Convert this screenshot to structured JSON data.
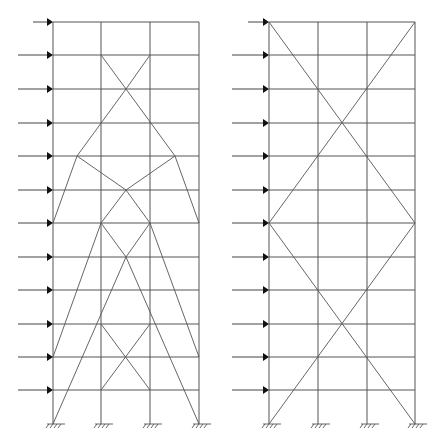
{
  "diagram": {
    "title": "",
    "colors": {
      "member": "#555555",
      "arrow": "#111111",
      "background": "#ffffff"
    },
    "floors_y": [
      22,
      55,
      89,
      123,
      156,
      190,
      223,
      257,
      290,
      324,
      357,
      390
    ],
    "base_y": 424,
    "frames": [
      {
        "name": "left-frame",
        "columns_x": [
          53,
          101,
          150,
          199
        ],
        "load_arrows": [
          {
            "x1": 33,
            "y": 22
          },
          {
            "x1": 18,
            "y": 55
          },
          {
            "x1": 18,
            "y": 89
          },
          {
            "x1": 18,
            "y": 123
          },
          {
            "x1": 18,
            "y": 156
          },
          {
            "x1": 18,
            "y": 190
          },
          {
            "x1": 18,
            "y": 223
          },
          {
            "x1": 18,
            "y": 257
          },
          {
            "x1": 18,
            "y": 290
          },
          {
            "x1": 18,
            "y": 324
          },
          {
            "x1": 18,
            "y": 357
          },
          {
            "x1": 18,
            "y": 390
          }
        ],
        "braces": [
          [
            101,
            55,
            126,
            89
          ],
          [
            150,
            55,
            126,
            89
          ],
          [
            126,
            89,
            77,
            156
          ],
          [
            126,
            89,
            175,
            156
          ],
          [
            77,
            156,
            53,
            223
          ],
          [
            175,
            156,
            199,
            223
          ],
          [
            77,
            156,
            126,
            190
          ],
          [
            175,
            156,
            126,
            190
          ],
          [
            126,
            190,
            101,
            223
          ],
          [
            126,
            190,
            150,
            223
          ],
          [
            101,
            223,
            126,
            257
          ],
          [
            150,
            223,
            126,
            257
          ],
          [
            101,
            223,
            53,
            357
          ],
          [
            150,
            223,
            199,
            357
          ],
          [
            126,
            257,
            53,
            424
          ],
          [
            126,
            257,
            199,
            424
          ],
          [
            101,
            324,
            150,
            390
          ],
          [
            150,
            324,
            101,
            390
          ]
        ]
      },
      {
        "name": "right-frame",
        "columns_x": [
          269,
          318,
          367,
          415
        ],
        "load_arrows": [
          {
            "x1": 248,
            "y": 22
          },
          {
            "x1": 232,
            "y": 55
          },
          {
            "x1": 232,
            "y": 89
          },
          {
            "x1": 232,
            "y": 123
          },
          {
            "x1": 232,
            "y": 156
          },
          {
            "x1": 232,
            "y": 190
          },
          {
            "x1": 232,
            "y": 223
          },
          {
            "x1": 232,
            "y": 257
          },
          {
            "x1": 232,
            "y": 290
          },
          {
            "x1": 232,
            "y": 324
          },
          {
            "x1": 232,
            "y": 357
          },
          {
            "x1": 232,
            "y": 390
          }
        ],
        "braces": [
          [
            269,
            22,
            415,
            223
          ],
          [
            415,
            22,
            269,
            223
          ],
          [
            269,
            223,
            415,
            424
          ],
          [
            415,
            223,
            269,
            424
          ]
        ]
      }
    ],
    "support_symbol": "fixed-support-hatch",
    "arrow_symbol": "lateral-load-arrow"
  }
}
